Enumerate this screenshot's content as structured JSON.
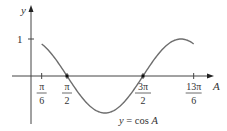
{
  "chart_data": {
    "type": "line",
    "title": "",
    "function": "y = cos A",
    "xlabel": "A",
    "ylabel": "y",
    "x_domain": [
      "π/6",
      "13π/6"
    ],
    "x_domain_numeric": [
      0.5236,
      6.8068
    ],
    "xlim": [
      0,
      7.2
    ],
    "ylim": [
      -1,
      1
    ],
    "x_ticks": [
      {
        "label_num": "π",
        "label_den": "6",
        "value": 0.5236
      },
      {
        "label_num": "π",
        "label_den": "2",
        "value": 1.5708
      },
      {
        "label_num": "3π",
        "label_den": "2",
        "value": 4.7124
      },
      {
        "label_num": "13π",
        "label_den": "6",
        "value": 6.8068
      }
    ],
    "y_ticks": [
      {
        "label": "1",
        "value": 1
      }
    ],
    "marked_points": [
      {
        "x": "π/2",
        "y": 0
      },
      {
        "x": "3π/2",
        "y": 0
      }
    ],
    "annotation": "y = cos A",
    "grid": false,
    "legend": null,
    "line_color": "#6e6e6e",
    "axis_color": "#444444"
  }
}
